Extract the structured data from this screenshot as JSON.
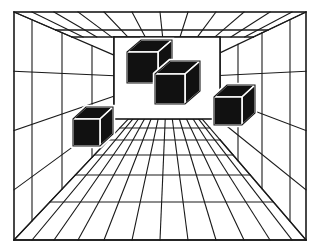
{
  "figure": {
    "type": "line-drawing",
    "background_color": "#ffffff",
    "line_color": "#1a1a1a",
    "cube_fill_color": "#111111",
    "cube_highlight_color": "#ffffff",
    "canvas": {
      "width": 320,
      "height": 251
    }
  },
  "scene": {
    "vanishing_point": {
      "x": 167,
      "y": 78
    },
    "outer_frame": {
      "x": 14,
      "y": 12,
      "width": 292,
      "height": 228
    },
    "back_wall": {
      "x": 114,
      "y": 37,
      "width": 106,
      "height": 82,
      "fill": "#ffffff"
    },
    "floor": {
      "label": "floor-grid",
      "near_edge_y": 240,
      "far_edge_y": 119,
      "radial_line_count": 13,
      "transverse_line_count": 7,
      "transverse_y": [
        119,
        128,
        140,
        155,
        175,
        202,
        240
      ],
      "near_x": [
        14,
        32,
        54,
        78,
        104,
        132,
        160,
        188,
        216,
        244,
        270,
        292,
        306
      ]
    },
    "ceiling": {
      "label": "ceiling-grid",
      "near_edge_y": 12,
      "far_edge_y": 37,
      "radial_line_count": 13,
      "transverse_line_count": 2,
      "transverse_y": [
        37,
        30
      ]
    },
    "left_wall": {
      "label": "left-wall-grid",
      "near_x": 14,
      "far_x": 114,
      "radial_line_count": 5,
      "vertical_line_count": 3,
      "vertical_x": [
        32,
        62,
        92
      ]
    },
    "right_wall": {
      "label": "right-wall-grid",
      "near_x": 306,
      "far_x": 220,
      "radial_line_count": 5,
      "vertical_line_count": 3,
      "vertical_x": [
        290,
        262,
        238
      ]
    },
    "cubes": [
      {
        "id": "cube-back-upper-left",
        "front": {
          "x": 127,
          "y": 52,
          "size": 31
        },
        "depth_dx": 14,
        "depth_dy": -12,
        "faces_visible": [
          "front",
          "top",
          "right"
        ]
      },
      {
        "id": "cube-center",
        "front": {
          "x": 155,
          "y": 74,
          "size": 30
        },
        "depth_dx": 15,
        "depth_dy": -13,
        "faces_visible": [
          "front",
          "top",
          "right"
        ]
      },
      {
        "id": "cube-right",
        "front": {
          "x": 214,
          "y": 97,
          "size": 28
        },
        "depth_dx": 13,
        "depth_dy": -12,
        "faces_visible": [
          "front",
          "top",
          "right"
        ]
      },
      {
        "id": "cube-left-low",
        "front": {
          "x": 73,
          "y": 119,
          "size": 27
        },
        "depth_dx": 13,
        "depth_dy": -12,
        "faces_visible": [
          "front",
          "top",
          "right"
        ]
      }
    ]
  }
}
